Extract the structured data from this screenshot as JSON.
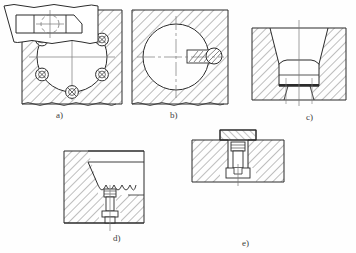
{
  "document": {
    "kind": "engineering-drawing",
    "sheet_background": "#fefefe",
    "line_color": "#2b2b2b",
    "hatch_color": "#555555",
    "centerline_color": "#7a7a7a",
    "caption_color": "#3c3c3c"
  },
  "figures": [
    {
      "id": "a",
      "caption": "a)",
      "description": "plan view of circular cavity in hatched block with six bolts on a bolt circle",
      "bolt_count": 6,
      "view": "top"
    },
    {
      "id": "b",
      "caption": "b)",
      "description": "plan view of circular cavity in hatched block with single side key and round pin",
      "bolt_count": 1,
      "view": "top"
    },
    {
      "id": "c",
      "caption": "c)",
      "description": "sectional elevation of tapered die insert seated in hatched holder",
      "view": "section"
    },
    {
      "id": "d",
      "caption": "d)",
      "description": "sectional elevation of tapered insert with serrated seat and retaining screw",
      "view": "section"
    },
    {
      "id": "e",
      "caption": "e)",
      "description": "sectional elevation over plan view of block with T-slot insert and retaining screw",
      "view": "section-and-plan"
    }
  ]
}
